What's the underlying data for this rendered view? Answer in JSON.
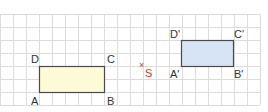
{
  "grid": {
    "cell": 13,
    "x0": 0,
    "y0": 14,
    "cols": 20,
    "rows": 7,
    "line_color": "#dcdcdc"
  },
  "figures": [
    {
      "name": "rectangle-ABCD",
      "x": 39,
      "y": 66,
      "w": 65,
      "h": 26,
      "fill": "#fdfbd5",
      "stroke": "#4a4a4a",
      "vertices": {
        "A": "A",
        "B": "B",
        "C": "C",
        "D": "D"
      }
    },
    {
      "name": "rectangle-A'B'C'D'",
      "x": 181,
      "y": 40,
      "w": 52,
      "h": 26,
      "fill": "#d6e4f5",
      "stroke": "#4a4a4a",
      "vertices": {
        "A": "A'",
        "B": "B'",
        "C": "C'",
        "D": "D'"
      }
    }
  ],
  "center": {
    "mark": "×",
    "label": "S",
    "color": "#c0392b"
  }
}
